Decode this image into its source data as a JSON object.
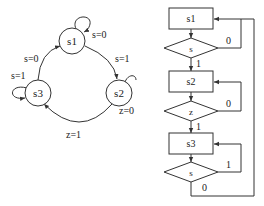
{
  "state_diagram": {
    "states": [
      {
        "id": "s1",
        "label": "s1"
      },
      {
        "id": "s2",
        "label": "s2"
      },
      {
        "id": "s3",
        "label": "s3"
      }
    ],
    "transitions": [
      {
        "from": "s1",
        "to": "s1",
        "label": "s=0"
      },
      {
        "from": "s1",
        "to": "s2",
        "label": "s=1"
      },
      {
        "from": "s2",
        "to": "s2",
        "label": "z=0"
      },
      {
        "from": "s2",
        "to": "s3",
        "label": "z=1"
      },
      {
        "from": "s3",
        "to": "s3",
        "label": "s=1"
      },
      {
        "from": "s3",
        "to": "s1",
        "label": "s=0"
      }
    ]
  },
  "flowchart": {
    "blocks": [
      {
        "state": "s1",
        "decision": "s",
        "loop_label": "0",
        "next_label": "1"
      },
      {
        "state": "s2",
        "decision": "z",
        "loop_label": "0",
        "next_label": "1"
      },
      {
        "state": "s3",
        "decision": "s",
        "loop_label": "1",
        "next_label": "0"
      }
    ]
  },
  "colors": {
    "stroke": "#333333",
    "background": "#ffffff"
  }
}
